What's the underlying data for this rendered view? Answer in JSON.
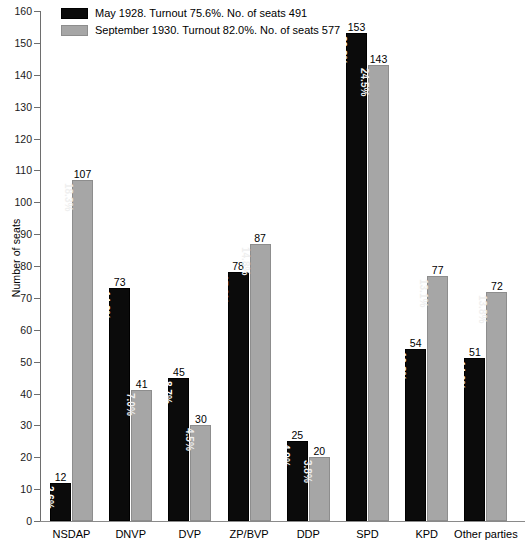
{
  "chart_data": {
    "type": "bar",
    "title": "",
    "xlabel": "",
    "ylabel": "Number of seats",
    "ylim": [
      0,
      160
    ],
    "ytick_step": 10,
    "grid": false,
    "legend_position": "top-left",
    "categories": [
      "NSDAP",
      "DNVP",
      "DVP",
      "ZP/BVP",
      "DDP",
      "SPD",
      "KPD",
      "Other parties"
    ],
    "series": [
      {
        "name": "May 1928. Turnout 75.6%. No. of seats 491",
        "short_name": "May 1928",
        "color": "#0b0b0b",
        "turnout": "75.6%",
        "total_seats": 491,
        "values": [
          12,
          73,
          45,
          78,
          25,
          153,
          54,
          51
        ],
        "percent_labels": [
          "2.6%",
          "14.2%",
          "8.7%",
          "15.2%",
          "4.9%",
          "29.8%",
          "10.8%",
          "14.0%"
        ]
      },
      {
        "name": "September 1930. Turnout 82.0%. No. of seats 577",
        "short_name": "September 1930",
        "color": "#a6a6a6",
        "turnout": "82.0%",
        "total_seats": 577,
        "values": [
          107,
          41,
          30,
          87,
          20,
          143,
          77,
          72
        ],
        "percent_labels": [
          "18.3%",
          "7.0%",
          "4.5%",
          "14.8%",
          "3.8%",
          "24.5%",
          "13.1%",
          "13.8%"
        ]
      }
    ],
    "yticks": [
      0,
      10,
      20,
      30,
      40,
      50,
      60,
      70,
      80,
      90,
      100,
      110,
      120,
      130,
      140,
      150,
      160
    ]
  }
}
